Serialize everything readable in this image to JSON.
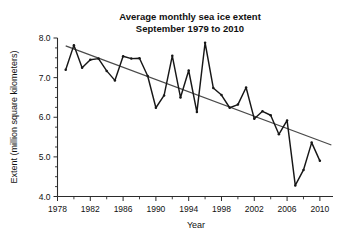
{
  "chart_data": {
    "type": "line",
    "title": "Average monthly sea ice extent",
    "subtitle": "September 1979 to 2010",
    "xlabel": "Year",
    "ylabel": "Extent (million square kilometers)",
    "xlim": [
      1978,
      2011.6
    ],
    "ylim": [
      4.0,
      8.0
    ],
    "grid": false,
    "legend": null,
    "x_major_ticks": [
      1978,
      1982,
      1986,
      1990,
      1994,
      1998,
      2002,
      2006,
      2010
    ],
    "x_major_tick_labels": [
      "1978",
      "1982",
      "1986",
      "1990",
      "1994",
      "1998",
      "2002",
      "2006",
      "2010"
    ],
    "x_minor_tick_interval": 2,
    "y_major_ticks": [
      4.0,
      5.0,
      6.0,
      7.0,
      8.0
    ],
    "y_major_tick_labels": [
      "4.0",
      "5.0",
      "6.0",
      "7.0",
      "8.0"
    ],
    "y_minor_tick_interval": 0.25,
    "series": [
      {
        "name": "September sea ice extent",
        "type": "line",
        "color": "#171717",
        "markers": true,
        "x": [
          1979,
          1980,
          1981,
          1982,
          1983,
          1984,
          1985,
          1986,
          1987,
          1988,
          1989,
          1990,
          1991,
          1992,
          1993,
          1994,
          1995,
          1996,
          1997,
          1998,
          1999,
          2000,
          2001,
          2002,
          2003,
          2004,
          2005,
          2006,
          2007,
          2008,
          2009,
          2010
        ],
        "values": [
          7.2,
          7.82,
          7.25,
          7.45,
          7.48,
          7.17,
          6.93,
          7.54,
          7.48,
          7.49,
          7.04,
          6.24,
          6.55,
          7.55,
          6.5,
          7.18,
          6.13,
          7.88,
          6.74,
          6.56,
          6.24,
          6.32,
          6.75,
          5.96,
          6.15,
          6.05,
          5.57,
          5.92,
          4.28,
          4.67,
          5.36,
          4.9
        ],
        "units": "million square kilometers"
      },
      {
        "name": "Linear trend",
        "type": "line",
        "color": "#4a4a4a",
        "markers": false,
        "x": [
          1979,
          2011.4
        ],
        "values": [
          7.8,
          5.3
        ]
      }
    ]
  }
}
